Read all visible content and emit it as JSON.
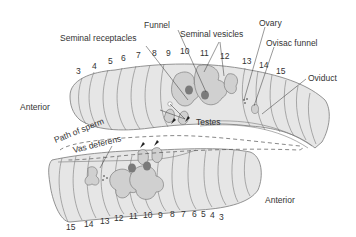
{
  "diagram": {
    "labels": {
      "funnel": "Funnel",
      "seminal_receptacles": "Seminal receptacles",
      "seminal_vesicles": "Seminal vesicles",
      "ovary": "Ovary",
      "ovisac_funnel": "Ovisac funnel",
      "oviduct": "Oviduct",
      "testes": "Testes",
      "path_of_sperm": "Path of sperm",
      "vas_deferens": "Vas deferens",
      "anterior_top": "Anterior",
      "anterior_bottom": "Anterior"
    },
    "top_segments": [
      "3",
      "4",
      "5",
      "6",
      "7",
      "8",
      "9",
      "10",
      "11",
      "12",
      "13",
      "14",
      "15"
    ],
    "bottom_segments": [
      "15",
      "14",
      "13",
      "12",
      "11",
      "10",
      "9",
      "8",
      "7",
      "6",
      "5",
      "4",
      "3"
    ],
    "colors": {
      "body_fill": "#e6e6e6",
      "outline": "#6f6f6f",
      "organ_fill": "#d0d0d0",
      "organ_dark": "#7a7a7a",
      "text": "#333333"
    }
  }
}
